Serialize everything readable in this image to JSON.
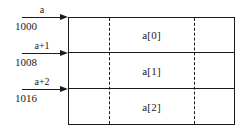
{
  "diagram": {
    "colors": {
      "line": "#1a1a1a",
      "background": "#ffffff"
    },
    "pointers": [
      {
        "name": "a",
        "address": "1000",
        "target": "a[0]"
      },
      {
        "name": "a+1",
        "address": "1008",
        "target": "a[1]"
      },
      {
        "name": "a+2",
        "address": "1016",
        "target": "a[2]"
      }
    ],
    "cells": [
      {
        "label": "a[0]"
      },
      {
        "label": "a[1]"
      },
      {
        "label": "a[2]"
      }
    ]
  }
}
